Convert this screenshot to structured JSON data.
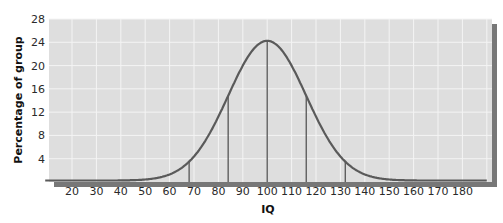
{
  "chart_data": {
    "type": "line",
    "title": "",
    "xlabel": "IQ",
    "ylabel": "Percentage of group",
    "x_ticks": [
      20,
      30,
      40,
      50,
      60,
      70,
      80,
      90,
      100,
      110,
      120,
      130,
      140,
      150,
      160,
      170,
      180
    ],
    "y_ticks": [
      4,
      8,
      12,
      16,
      20,
      24,
      28
    ],
    "xlim": [
      10,
      190
    ],
    "ylim": [
      0,
      28
    ],
    "grid": true,
    "legend": null,
    "series": [
      {
        "name": "Normal distribution of IQ",
        "mean": 100,
        "sd": 16,
        "x": [
          10,
          20,
          30,
          40,
          50,
          60,
          68,
          70,
          80,
          84,
          90,
          100,
          110,
          116,
          120,
          130,
          132,
          140,
          150,
          160,
          170,
          180,
          190
        ],
        "values": [
          0.1,
          0.4,
          0.9,
          1.8,
          3.5,
          6.3,
          10.2,
          10.5,
          17.7,
          19.5,
          22.1,
          24.0,
          22.1,
          19.5,
          17.7,
          10.5,
          10.2,
          6.3,
          3.5,
          1.8,
          0.9,
          0.4,
          0.1
        ]
      }
    ],
    "annotations": {
      "vertical_lines_at": [
        68,
        84,
        100,
        116,
        132
      ],
      "description": "Vertical lines drop from the curve at the mean and at ±1 and ±2 standard deviations"
    }
  },
  "labels": {
    "ylabel": "Percentage of group",
    "xlabel": "IQ",
    "y": [
      "28",
      "24",
      "20",
      "16",
      "12",
      "8",
      "4"
    ],
    "x": [
      "20",
      "30",
      "40",
      "50",
      "60",
      "70",
      "80",
      "90",
      "100",
      "110",
      "120",
      "130",
      "140",
      "150",
      "160",
      "170",
      "180"
    ]
  },
  "colors": {
    "plot_bg": "#dedede",
    "grid": "#f4f4f4",
    "curve": "#5a5a5a",
    "shadow": "#6e6e6e"
  }
}
